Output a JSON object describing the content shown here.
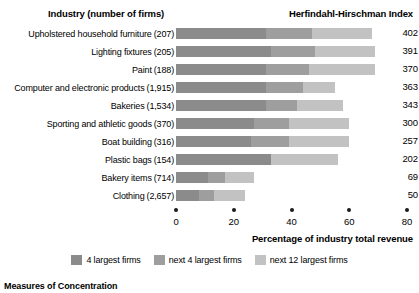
{
  "header": {
    "industry_label": "Industry (number of firms)",
    "index_label": "Herfindahl-Hirschman Index"
  },
  "axis": {
    "title": "Percentage of industry total revenue",
    "ticks": [
      0,
      20,
      40,
      60,
      80
    ],
    "min": 0,
    "max": 80
  },
  "legend": {
    "items": [
      {
        "label": "4 largest firms",
        "color": "#8b8b8b",
        "swatch_name": "legend-swatch-s1"
      },
      {
        "label": "next 4 largest firms",
        "color": "#9e9e9e",
        "swatch_name": "legend-swatch-s2"
      },
      {
        "label": "next 12 largest firms",
        "color": "#c2c2c2",
        "swatch_name": "legend-swatch-s3"
      }
    ]
  },
  "footer": {
    "caption": "Measures of Concentration"
  },
  "chart_data": {
    "type": "bar",
    "orientation": "horizontal",
    "stacked": true,
    "title": "",
    "xlabel": "Percentage of industry total revenue",
    "ylabel": "Industry (number of firms)",
    "xlim": [
      0,
      80
    ],
    "grid": false,
    "legend_position": "bottom-center",
    "categories": [
      "Upholstered household furniture",
      "Lighting fixtures",
      "Paint",
      "Computer and electronic products",
      "Bakeries",
      "Sporting and athletic goods",
      "Boat building",
      "Plastic bags",
      "Bakery items",
      "Clothing"
    ],
    "firm_counts": [
      "(207)",
      "(205)",
      "(188)",
      "(1,915)",
      "(1,534)",
      "(370)",
      "(316)",
      "(154)",
      "(714)",
      "(2,657)"
    ],
    "series": [
      {
        "name": "4 largest firms",
        "color": "#8b8b8b",
        "values": [
          31,
          33,
          31,
          31,
          31,
          27,
          26,
          33,
          11,
          8
        ]
      },
      {
        "name": "next 4 largest firms",
        "color": "#9e9e9e",
        "values": [
          16,
          15,
          15,
          13,
          11,
          12,
          13,
          0,
          6,
          5
        ]
      },
      {
        "name": "next 12 largest firms",
        "color": "#c2c2c2",
        "values": [
          21,
          21,
          23,
          11,
          16,
          21,
          21,
          23,
          10,
          11
        ]
      }
    ],
    "hhi_values": [
      402,
      391,
      370,
      363,
      343,
      300,
      257,
      202,
      69,
      50
    ],
    "rows": [
      {
        "label": "Upholstered household furniture",
        "firms": "(207)",
        "segments": [
          31,
          16,
          21
        ],
        "hhi": 402
      },
      {
        "label": "Lighting fixtures",
        "firms": "(205)",
        "segments": [
          33,
          15,
          21
        ],
        "hhi": 391
      },
      {
        "label": "Paint",
        "firms": "(188)",
        "segments": [
          31,
          15,
          23
        ],
        "hhi": 370
      },
      {
        "label": "Computer and electronic products",
        "firms": "(1,915)",
        "segments": [
          31,
          13,
          11
        ],
        "hhi": 363
      },
      {
        "label": "Bakeries",
        "firms": "(1,534)",
        "segments": [
          31,
          11,
          16
        ],
        "hhi": 343
      },
      {
        "label": "Sporting and athletic goods",
        "firms": "(370)",
        "segments": [
          27,
          12,
          21
        ],
        "hhi": 300
      },
      {
        "label": "Boat building",
        "firms": "(316)",
        "segments": [
          26,
          13,
          21
        ],
        "hhi": 257
      },
      {
        "label": "Plastic bags",
        "firms": "(154)",
        "segments": [
          33,
          0,
          23
        ],
        "hhi": 202
      },
      {
        "label": "Bakery items",
        "firms": "(714)",
        "segments": [
          11,
          6,
          10
        ],
        "hhi": 69
      },
      {
        "label": "Clothing",
        "firms": "(2,657)",
        "segments": [
          8,
          5,
          11
        ],
        "hhi": 50
      }
    ]
  }
}
